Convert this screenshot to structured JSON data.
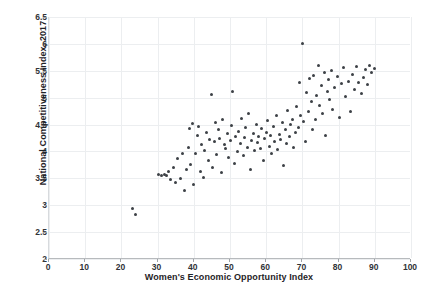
{
  "top_clipped_text": "  ",
  "chart_data": {
    "type": "scatter",
    "title": "",
    "xlabel": "Women's Economic Opportunity Index",
    "ylabel": "National Competitiveness Index, 2017",
    "xlim": [
      0,
      100
    ],
    "ylim": [
      2,
      6.5
    ],
    "xticks": [
      0,
      10,
      20,
      30,
      40,
      50,
      60,
      70,
      80,
      90,
      100
    ],
    "yticks": [
      2,
      2.5,
      3,
      3.5,
      4,
      4.5,
      5,
      5.5,
      6,
      6.5
    ],
    "grid": true,
    "legend": "none",
    "marker_color": "#3d4146",
    "marker_size": 3,
    "points": [
      [
        23.2,
        2.93
      ],
      [
        24.0,
        2.82
      ],
      [
        30.2,
        3.58
      ],
      [
        31.0,
        3.56
      ],
      [
        31.8,
        3.57
      ],
      [
        32.4,
        3.55
      ],
      [
        33.0,
        3.62
      ],
      [
        33.6,
        3.47
      ],
      [
        34.4,
        3.7
      ],
      [
        35.0,
        3.42
      ],
      [
        35.6,
        3.86
      ],
      [
        36.2,
        3.5
      ],
      [
        36.8,
        3.97
      ],
      [
        37.4,
        3.28
      ],
      [
        38.0,
        3.66
      ],
      [
        38.6,
        4.08
      ],
      [
        38.8,
        4.42
      ],
      [
        39.2,
        3.75
      ],
      [
        39.6,
        4.52
      ],
      [
        40.0,
        3.38
      ],
      [
        40.4,
        3.96
      ],
      [
        41.0,
        4.3
      ],
      [
        41.4,
        4.47
      ],
      [
        41.8,
        3.63
      ],
      [
        42.2,
        4.13
      ],
      [
        42.6,
        3.52
      ],
      [
        43.0,
        4.02
      ],
      [
        43.6,
        4.35
      ],
      [
        44.0,
        3.84
      ],
      [
        44.4,
        4.22
      ],
      [
        44.8,
        5.06
      ],
      [
        45.2,
        3.7
      ],
      [
        45.6,
        4.18
      ],
      [
        46.0,
        4.53
      ],
      [
        46.4,
        3.95
      ],
      [
        46.8,
        4.4
      ],
      [
        47.2,
        4.25
      ],
      [
        47.6,
        3.6
      ],
      [
        48.0,
        4.6
      ],
      [
        48.4,
        4.12
      ],
      [
        48.8,
        4.05
      ],
      [
        49.2,
        4.33
      ],
      [
        49.6,
        3.88
      ],
      [
        50.0,
        4.2
      ],
      [
        50.4,
        4.48
      ],
      [
        50.8,
        5.12
      ],
      [
        51.2,
        3.78
      ],
      [
        51.6,
        4.28
      ],
      [
        52.0,
        4.0
      ],
      [
        52.4,
        4.38
      ],
      [
        52.8,
        4.15
      ],
      [
        53.2,
        4.62
      ],
      [
        53.6,
        3.92
      ],
      [
        54.0,
        4.26
      ],
      [
        54.4,
        4.44
      ],
      [
        54.8,
        4.08
      ],
      [
        55.2,
        4.7
      ],
      [
        55.6,
        3.66
      ],
      [
        56.0,
        4.2
      ],
      [
        56.4,
        4.34
      ],
      [
        56.8,
        4.02
      ],
      [
        57.2,
        4.5
      ],
      [
        57.6,
        4.16
      ],
      [
        58.0,
        4.28
      ],
      [
        58.4,
        4.06
      ],
      [
        58.8,
        4.42
      ],
      [
        59.2,
        3.84
      ],
      [
        59.6,
        4.24
      ],
      [
        60.0,
        4.36
      ],
      [
        60.4,
        4.58
      ],
      [
        60.8,
        4.1
      ],
      [
        61.2,
        4.3
      ],
      [
        61.6,
        3.96
      ],
      [
        62.0,
        4.46
      ],
      [
        62.4,
        4.18
      ],
      [
        62.8,
        4.66
      ],
      [
        63.2,
        4.04
      ],
      [
        63.6,
        4.32
      ],
      [
        64.0,
        4.22
      ],
      [
        64.4,
        4.54
      ],
      [
        64.8,
        3.74
      ],
      [
        65.2,
        4.4
      ],
      [
        65.6,
        4.14
      ],
      [
        66.0,
        4.76
      ],
      [
        66.4,
        4.28
      ],
      [
        66.8,
        4.5
      ],
      [
        67.2,
        4.6
      ],
      [
        67.6,
        4.08
      ],
      [
        68.0,
        4.36
      ],
      [
        68.4,
        4.84
      ],
      [
        68.8,
        4.44
      ],
      [
        69.2,
        5.28
      ],
      [
        69.6,
        4.66
      ],
      [
        70.0,
        6.0
      ],
      [
        70.4,
        4.56
      ],
      [
        70.8,
        4.18
      ],
      [
        71.2,
        5.1
      ],
      [
        71.6,
        4.74
      ],
      [
        72.0,
        5.36
      ],
      [
        72.4,
        4.92
      ],
      [
        72.8,
        4.4
      ],
      [
        73.2,
        5.42
      ],
      [
        73.6,
        4.6
      ],
      [
        74.0,
        5.04
      ],
      [
        74.4,
        5.6
      ],
      [
        74.8,
        4.86
      ],
      [
        75.2,
        5.22
      ],
      [
        75.6,
        4.7
      ],
      [
        76.0,
        5.46
      ],
      [
        76.4,
        4.3
      ],
      [
        76.8,
        5.12
      ],
      [
        77.2,
        5.34
      ],
      [
        77.6,
        4.96
      ],
      [
        78.0,
        5.5
      ],
      [
        78.4,
        4.78
      ],
      [
        79.0,
        5.18
      ],
      [
        79.6,
        5.4
      ],
      [
        80.2,
        4.64
      ],
      [
        80.8,
        5.26
      ],
      [
        81.4,
        5.56
      ],
      [
        82.0,
        5.02
      ],
      [
        82.6,
        5.3
      ],
      [
        83.2,
        4.74
      ],
      [
        83.8,
        5.44
      ],
      [
        84.4,
        5.16
      ],
      [
        85.0,
        5.58
      ],
      [
        85.6,
        5.28
      ],
      [
        86.2,
        5.08
      ],
      [
        86.8,
        5.38
      ],
      [
        87.4,
        5.52
      ],
      [
        88.0,
        5.24
      ],
      [
        88.6,
        5.6
      ],
      [
        89.2,
        5.46
      ],
      [
        89.8,
        5.54
      ]
    ]
  }
}
